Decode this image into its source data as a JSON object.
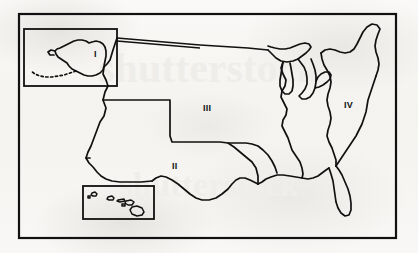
{
  "figure": {
    "background_color": "#f7f6f4",
    "line_color": "#111111",
    "width": 418,
    "height": 253
  },
  "frame": {
    "name": "map-border",
    "x": 19,
    "y": 14,
    "width": 377,
    "height": 224,
    "stroke_width": 2.2
  },
  "watermark": {
    "text": "Shutterstock",
    "visible": false,
    "color": "#ebe9e6"
  },
  "insets": [
    {
      "name": "alaska-inset",
      "label": "I",
      "x": 24,
      "y": 29,
      "width": 93,
      "height": 57,
      "label_x": 94,
      "label_y": 50
    },
    {
      "name": "hawaii-inset",
      "label": "",
      "x": 83,
      "y": 186,
      "width": 71,
      "height": 33,
      "label_x": 0,
      "label_y": 0
    }
  ],
  "regions": [
    {
      "id": "region-1",
      "label": "I",
      "name": "alaska-region-label",
      "x": 94,
      "y": 50
    },
    {
      "id": "region-2",
      "label": "II",
      "name": "southwest-region-label",
      "x": 172,
      "y": 162
    },
    {
      "id": "region-3",
      "label": "III",
      "name": "central-region-label",
      "x": 205,
      "y": 104
    },
    {
      "id": "region-4",
      "label": "IV",
      "name": "northeast-region-label",
      "x": 344,
      "y": 101
    }
  ]
}
